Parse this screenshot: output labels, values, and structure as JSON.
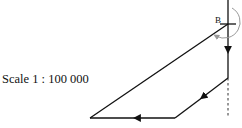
{
  "scale": {
    "label": "Scale 1 : 100 000"
  },
  "points": {
    "B": {
      "label": "B",
      "x": 228,
      "y": 24
    }
  },
  "colors": {
    "line": "#111111",
    "arc": "#9a9a9a",
    "dashed": "#333333"
  },
  "path": {
    "segments": [
      {
        "from": [
          228,
          24
        ],
        "to": [
          228,
          78
        ],
        "arrow": "down"
      },
      {
        "from": [
          228,
          78
        ],
        "to": [
          175,
          118
        ],
        "arrow": "down-left"
      },
      {
        "from": [
          175,
          118
        ],
        "to": [
          90,
          118
        ],
        "arrow": "left"
      },
      {
        "from": [
          90,
          118
        ],
        "to": [
          228,
          24
        ],
        "arrow": "none"
      }
    ],
    "north_line": {
      "from": [
        228,
        0
      ],
      "to": [
        228,
        24
      ]
    },
    "extension_dashed": {
      "from": [
        228,
        78
      ],
      "to": [
        228,
        118
      ]
    }
  },
  "bearing_arc": {
    "center": [
      228,
      24
    ],
    "direction": "clockwise"
  }
}
